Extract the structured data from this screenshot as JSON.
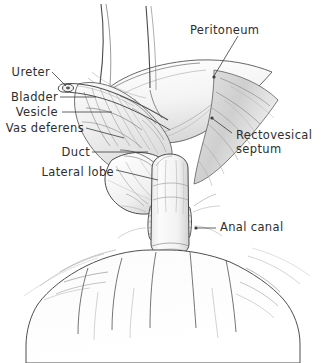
{
  "figure": {
    "background_color": "#ffffff",
    "ink_color": "#2e2e2e",
    "width": 326,
    "height": 363
  },
  "labels": {
    "peritoneum": "Peritoneum",
    "ureter": "Ureter",
    "bladder": "Bladder",
    "vesicle": "Vesicle",
    "vas_deferens": "Vas deferens",
    "duct": "Duct",
    "lateral_lobe": "Lateral lobe",
    "rectovesical_septum_line1": "Rectovesical",
    "rectovesical_septum_line2": "septum",
    "anal_canal": "Anal canal"
  }
}
